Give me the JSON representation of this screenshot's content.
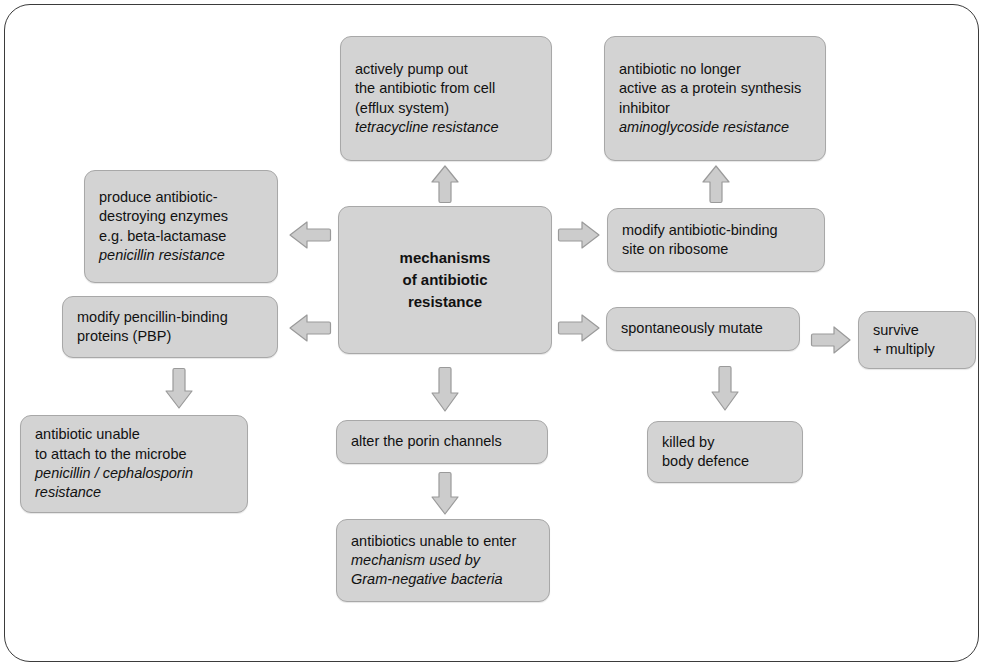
{
  "diagram": {
    "title": "mechanisms of antibiotic resistance",
    "colors": {
      "node_fill": "#d3d3d3",
      "node_border": "#a8a8a8",
      "arrow_fill": "#cccccc",
      "arrow_border": "#9a9a9a",
      "frame_border": "#3b3b3b",
      "background": "#ffffff",
      "text": "#111111"
    },
    "nodes": {
      "center": {
        "name": "mechanisms-of-antibiotic-resistance",
        "lines": [
          {
            "text": "mechanisms",
            "italic": false
          },
          {
            "text": "of antibiotic",
            "italic": false
          },
          {
            "text": "resistance",
            "italic": false
          }
        ]
      },
      "efflux": {
        "name": "efflux-pump",
        "lines": [
          {
            "text": "actively pump out",
            "italic": false
          },
          {
            "text": "the antibiotic from cell",
            "italic": false
          },
          {
            "text": "(efflux system)",
            "italic": false
          },
          {
            "text": "tetracycline resistance",
            "italic": true
          }
        ]
      },
      "aminoglycoside": {
        "name": "protein-synthesis-inhibition-loss",
        "lines": [
          {
            "text": "antibiotic no longer",
            "italic": false
          },
          {
            "text": "active as a protein synthesis",
            "italic": false
          },
          {
            "text": "inhibitor",
            "italic": false
          },
          {
            "text": "aminoglycoside resistance",
            "italic": true
          }
        ]
      },
      "enzymes": {
        "name": "antibiotic-destroying-enzymes",
        "lines": [
          {
            "text": "produce antibiotic-",
            "italic": false
          },
          {
            "text": "destroying enzymes",
            "italic": false
          },
          {
            "text": "e.g. beta-lactamase",
            "italic": false
          },
          {
            "text": "penicillin resistance",
            "italic": true
          }
        ]
      },
      "ribosome": {
        "name": "modify-ribosome-binding-site",
        "lines": [
          {
            "text": "modify antibiotic-binding",
            "italic": false
          },
          {
            "text": "site on ribosome",
            "italic": false
          }
        ]
      },
      "pbp": {
        "name": "modify-penicillin-binding-proteins",
        "lines": [
          {
            "text": "modify pencillin-binding",
            "italic": false
          },
          {
            "text": "proteins (PBP)",
            "italic": false
          }
        ]
      },
      "mutate": {
        "name": "spontaneously-mutate",
        "lines": [
          {
            "text": "spontaneously mutate",
            "italic": false
          }
        ]
      },
      "survive": {
        "name": "survive-and-multiply",
        "lines": [
          {
            "text": "survive",
            "italic": false
          },
          {
            "text": "+ multiply",
            "italic": false
          }
        ]
      },
      "unable_attach": {
        "name": "antibiotic-unable-to-attach",
        "lines": [
          {
            "text": "antibiotic unable",
            "italic": false
          },
          {
            "text": "to attach to the microbe",
            "italic": false
          },
          {
            "text": "penicillin / cephalosporin",
            "italic": true
          },
          {
            "text": "resistance",
            "italic": true
          }
        ]
      },
      "porin": {
        "name": "alter-porin-channels",
        "lines": [
          {
            "text": "alter the porin channels",
            "italic": false
          }
        ]
      },
      "killed": {
        "name": "killed-by-body-defence",
        "lines": [
          {
            "text": "killed by",
            "italic": false
          },
          {
            "text": "body defence",
            "italic": false
          }
        ]
      },
      "unable_enter": {
        "name": "antibiotics-unable-to-enter",
        "lines": [
          {
            "text": "antibiotics unable to enter",
            "italic": false
          },
          {
            "text": "mechanism used by",
            "italic": true
          },
          {
            "text": "Gram-negative  bacteria",
            "italic": true
          }
        ]
      }
    },
    "arrows": [
      {
        "name": "arrow-center-to-efflux",
        "direction": "up"
      },
      {
        "name": "arrow-ribosome-to-aminoglycoside",
        "direction": "up"
      },
      {
        "name": "arrow-center-to-enzymes",
        "direction": "left"
      },
      {
        "name": "arrow-center-to-ribosome",
        "direction": "right"
      },
      {
        "name": "arrow-center-to-pbp",
        "direction": "left"
      },
      {
        "name": "arrow-center-to-mutate",
        "direction": "right"
      },
      {
        "name": "arrow-mutate-to-survive",
        "direction": "right"
      },
      {
        "name": "arrow-pbp-to-unable-attach",
        "direction": "down"
      },
      {
        "name": "arrow-center-to-porin",
        "direction": "down"
      },
      {
        "name": "arrow-mutate-to-killed",
        "direction": "down"
      },
      {
        "name": "arrow-porin-to-unable-enter",
        "direction": "down"
      }
    ]
  }
}
